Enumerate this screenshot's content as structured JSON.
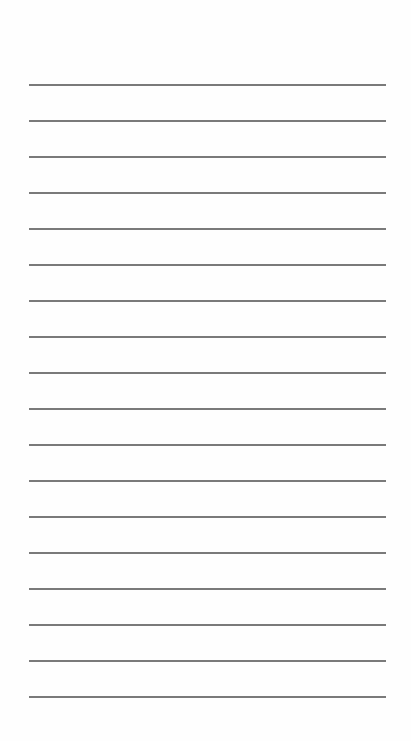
{
  "page": {
    "type": "lined-paper",
    "background_color": "#fefefe",
    "rule_color": "#7a7a7a",
    "rule_count": 18,
    "first_rule_y": 84,
    "rule_spacing": 36,
    "rule_left": 29,
    "rule_width": 357
  }
}
